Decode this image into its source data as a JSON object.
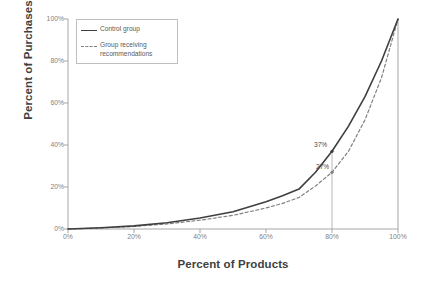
{
  "chart_data": {
    "type": "line",
    "title": "",
    "xlabel": "Percent of Products",
    "ylabel": "Percent of Purchases",
    "xlim": [
      0,
      100
    ],
    "ylim": [
      0,
      100
    ],
    "grid": false,
    "legend_position": "top-left-inside",
    "x_ticks": [
      "0%",
      "20%",
      "40%",
      "60%",
      "80%",
      "100%"
    ],
    "y_ticks": [
      "0%",
      "20%",
      "40%",
      "60%",
      "80%",
      "100%"
    ],
    "x_tick_values": [
      0,
      20,
      40,
      60,
      80,
      100
    ],
    "y_tick_values": [
      0,
      20,
      40,
      60,
      80,
      100
    ],
    "series": [
      {
        "name": "Control group",
        "style": "solid",
        "color": "#3f3f3f",
        "x": [
          0,
          10,
          20,
          30,
          40,
          50,
          60,
          65,
          70,
          75,
          80,
          85,
          90,
          95,
          100
        ],
        "values": [
          0,
          0.6,
          1.5,
          3,
          5.2,
          8.2,
          13,
          15.8,
          19,
          27,
          37,
          49,
          63,
          80,
          100
        ]
      },
      {
        "name": "Group receiving recommendations",
        "style": "dashed",
        "color": "#808080",
        "x": [
          0,
          10,
          20,
          30,
          40,
          50,
          60,
          65,
          70,
          75,
          80,
          85,
          90,
          95,
          100
        ],
        "values": [
          0,
          0.5,
          1.2,
          2.4,
          4.2,
          6.5,
          10,
          12.2,
          15,
          20.5,
          27,
          37,
          52,
          72,
          100
        ]
      }
    ],
    "annotations": [
      {
        "label": "37%",
        "x": 80,
        "y": 37,
        "series": "Control group"
      },
      {
        "label": "27%",
        "x": 80,
        "y": 27,
        "series": "Group receiving recommendations"
      }
    ],
    "reference_line": {
      "x": 80,
      "from_y": 0,
      "to_y": 37,
      "color": "#a6a6a6"
    }
  },
  "axes": {
    "y_title": "Percent of Purchases",
    "x_title": "Percent of Products"
  },
  "legend": {
    "items": [
      {
        "label": "Control group"
      },
      {
        "label": "Group receiving recommendations"
      }
    ]
  },
  "colors": {
    "control": "#3f3f3f",
    "recommendations": "#808080",
    "axis": "#a6a6a6",
    "tick_text": "#7f7f7f",
    "title_text": "#404040"
  }
}
